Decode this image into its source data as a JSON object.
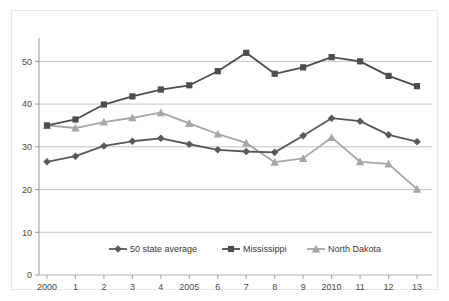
{
  "chart_data": {
    "type": "line",
    "title": "",
    "subtitle": "",
    "xlabel": "",
    "ylabel": "",
    "x": [
      2000,
      2001,
      2002,
      2003,
      2004,
      2005,
      2006,
      2007,
      2008,
      2009,
      2010,
      2011,
      2012,
      2013
    ],
    "categories": [
      "2000",
      "1",
      "2",
      "3",
      "4",
      "2005",
      "6",
      "7",
      "8",
      "9",
      "2010",
      "11",
      "12",
      "13"
    ],
    "xtick_labels": [
      "2000",
      "1",
      "2",
      "3",
      "4",
      "2005",
      "6",
      "7",
      "8",
      "9",
      "2010",
      "11",
      "12",
      "13"
    ],
    "ytick_labels": [
      "0",
      "10",
      "20",
      "30",
      "40",
      "50"
    ],
    "yticks": [
      0,
      10,
      20,
      30,
      40,
      50
    ],
    "ylim": [
      0,
      55
    ],
    "grid": true,
    "grid_axis": "y",
    "legend_position": "bottom",
    "series": [
      {
        "name": "50 state average",
        "marker": "diamond",
        "color": "#595959",
        "values": [
          26.5,
          27.8,
          30.2,
          31.3,
          32.0,
          30.6,
          29.3,
          28.9,
          28.7,
          32.6,
          36.7,
          36.0,
          32.8,
          31.2
        ]
      },
      {
        "name": "Mississippi",
        "marker": "square",
        "color": "#4d4d4d",
        "values": [
          35.0,
          36.4,
          39.9,
          41.8,
          43.4,
          44.4,
          47.7,
          52.0,
          47.1,
          48.6,
          51.0,
          50.0,
          46.6,
          44.2
        ]
      },
      {
        "name": "North Dakota",
        "marker": "triangle",
        "color": "#a6a6a6",
        "values": [
          35.0,
          34.4,
          35.8,
          36.8,
          38.0,
          35.5,
          33.0,
          30.9,
          26.4,
          27.3,
          32.2,
          26.5,
          26.0,
          20.1
        ]
      }
    ]
  },
  "legend": {
    "items": [
      {
        "label": "50 state average"
      },
      {
        "label": "Mississippi"
      },
      {
        "label": "North Dakota"
      }
    ]
  },
  "colors": {
    "series_50_state_average": "#595959",
    "series_mississippi": "#4d4d4d",
    "series_north_dakota": "#a6a6a6",
    "gridline": "#aaaaaa",
    "axis": "#8c8c8c",
    "frame_border": "#e8e8e8",
    "background": "#ffffff",
    "tick_text": "#4a4a4a"
  }
}
